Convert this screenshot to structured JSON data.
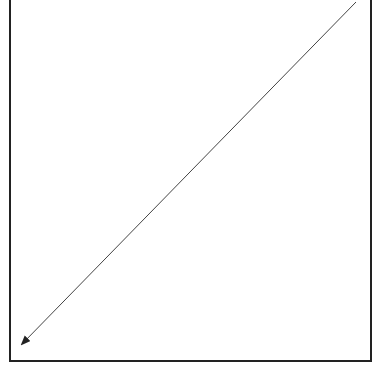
{
  "diagram": {
    "frame": {
      "left": 10,
      "right": 370,
      "top": 0,
      "bottom": 361,
      "stroke": "#222222",
      "top_edge_visible": false
    },
    "arrow": {
      "from": [
        356,
        2
      ],
      "to": [
        18,
        348
      ],
      "stroke": "#333333",
      "head": "end"
    },
    "caption": ""
  }
}
